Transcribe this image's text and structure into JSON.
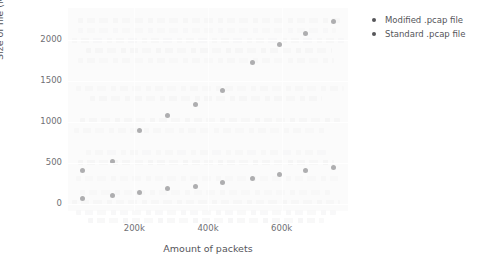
{
  "chart_data": {
    "type": "scatter",
    "title": "",
    "xlabel": "Amount of packets",
    "ylabel": "Size of file (MB)",
    "xlim": [
      20000,
      780000
    ],
    "ylim": [
      -90,
      2390
    ],
    "grid": true,
    "legend_position": "right",
    "xticks": [
      {
        "value": 200000,
        "label": "200k"
      },
      {
        "value": 400000,
        "label": "400k"
      },
      {
        "value": 600000,
        "label": "600k"
      }
    ],
    "yticks": [
      {
        "value": 0,
        "label": "0"
      },
      {
        "value": 500,
        "label": "500"
      },
      {
        "value": 1000,
        "label": "1000"
      },
      {
        "value": 1500,
        "label": "1500"
      },
      {
        "value": 2000,
        "label": "2000"
      }
    ],
    "marker_color": "#565659",
    "panel_color": "#f7f7f8",
    "series": [
      {
        "name": "Modified .pcap file",
        "color": "#565659",
        "marker": "circle",
        "points": [
          {
            "x": 60000,
            "y": 400
          },
          {
            "x": 140000,
            "y": 520
          },
          {
            "x": 215000,
            "y": 890
          },
          {
            "x": 290000,
            "y": 1075
          },
          {
            "x": 365000,
            "y": 1215
          },
          {
            "x": 440000,
            "y": 1380
          },
          {
            "x": 520000,
            "y": 1730
          },
          {
            "x": 595000,
            "y": 1940
          },
          {
            "x": 665000,
            "y": 2080
          },
          {
            "x": 740000,
            "y": 2230
          }
        ]
      },
      {
        "name": "Standard .pcap file",
        "color": "#565659",
        "marker": "circle",
        "points": [
          {
            "x": 60000,
            "y": 60
          },
          {
            "x": 140000,
            "y": 95
          },
          {
            "x": 215000,
            "y": 135
          },
          {
            "x": 290000,
            "y": 180
          },
          {
            "x": 365000,
            "y": 215
          },
          {
            "x": 440000,
            "y": 255
          },
          {
            "x": 520000,
            "y": 305
          },
          {
            "x": 595000,
            "y": 355
          },
          {
            "x": 665000,
            "y": 400
          },
          {
            "x": 740000,
            "y": 445
          }
        ]
      }
    ]
  },
  "legend": {
    "entries": [
      {
        "label": "Modified .pcap file"
      },
      {
        "label": "Standard .pcap file"
      }
    ]
  }
}
